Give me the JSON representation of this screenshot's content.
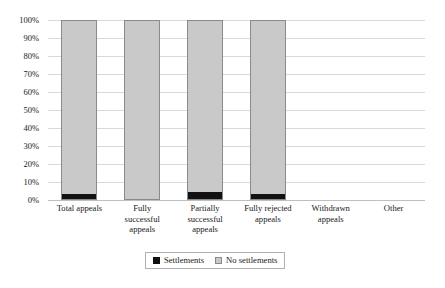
{
  "chart_data": {
    "type": "bar",
    "subtype": "stacked-100-percent",
    "title": "",
    "xlabel": "",
    "ylabel": "",
    "ylim": [
      0,
      100
    ],
    "ytick_labels": [
      "100%",
      "90%",
      "80%",
      "70%",
      "60%",
      "50%",
      "40%",
      "30%",
      "20%",
      "10%",
      "0%"
    ],
    "ytick_values": [
      100,
      90,
      80,
      70,
      60,
      50,
      40,
      30,
      20,
      10,
      0
    ],
    "grid": true,
    "legend_position": "bottom-center",
    "categories": [
      "Total appeals",
      "Fully successful appeals",
      "Partially successful appeals",
      "Fully rejected appeals",
      "Withdrawn appeals",
      "Other"
    ],
    "category_lines": [
      [
        "Total appeals"
      ],
      [
        "Fully",
        "successful",
        "appeals"
      ],
      [
        "Partially",
        "successful",
        "appeals"
      ],
      [
        "Fully rejected",
        "appeals"
      ],
      [
        "Withdrawn",
        "appeals"
      ],
      [
        "Other"
      ]
    ],
    "series": [
      {
        "name": "Settlements",
        "color": "#111111",
        "values": [
          3,
          0,
          4,
          3,
          null,
          null
        ]
      },
      {
        "name": "No settlements",
        "color": "#c9c9c9",
        "values": [
          97,
          100,
          96,
          97,
          null,
          null
        ]
      }
    ],
    "bars_rendered": [
      true,
      true,
      true,
      true,
      false,
      false
    ]
  },
  "legend": {
    "items": [
      {
        "label": "Settlements",
        "swatch": "settlements"
      },
      {
        "label": "No settlements",
        "swatch": "no-settlements"
      }
    ]
  },
  "colors": {
    "settlements": "#111111",
    "no_settlements": "#c9c9c9",
    "bar_border": "#8a8a8a",
    "gridline": "#d9d9d9",
    "baseline": "#bfbfbf",
    "text": "#1a1a1a"
  }
}
